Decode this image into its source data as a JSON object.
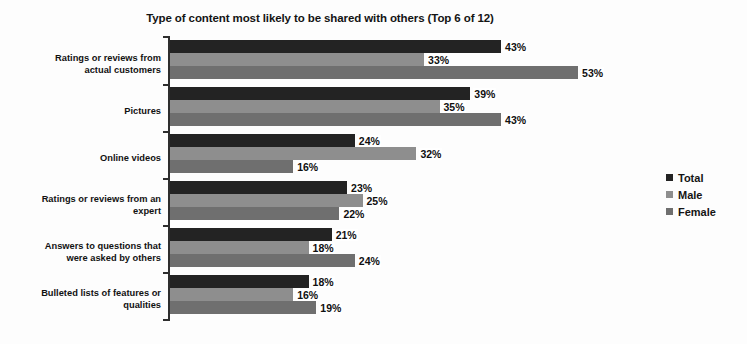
{
  "chart_data": {
    "type": "bar",
    "orientation": "horizontal",
    "title": "Type of content most likely to be shared with others (Top 6 of 12)",
    "xlabel": "",
    "ylabel": "",
    "xlim": [
      0,
      60
    ],
    "grid": false,
    "legend_position": "right",
    "value_suffix": "%",
    "categories": [
      "Ratings or reviews from actual customers",
      "Pictures",
      "Online videos",
      "Ratings or reviews from an expert",
      "Answers to questions that were asked by others",
      "Bulleted lists of features or qualities"
    ],
    "category_lines": [
      [
        "Ratings or reviews from",
        "actual customers"
      ],
      [
        "Pictures"
      ],
      [
        "Online videos"
      ],
      [
        "Ratings or reviews from an",
        "expert"
      ],
      [
        "Answers to questions that",
        "were asked by others"
      ],
      [
        "Bulleted lists of features or",
        "qualities"
      ]
    ],
    "series": [
      {
        "name": "Total",
        "color": "#232323",
        "values": [
          43,
          39,
          24,
          23,
          21,
          18
        ],
        "labels": [
          "43%",
          "39%",
          "24%",
          "23%",
          "21%",
          "18%"
        ]
      },
      {
        "name": "Male",
        "color": "#8e8e8e",
        "values": [
          33,
          35,
          32,
          25,
          18,
          16
        ],
        "labels": [
          "33%",
          "35%",
          "32%",
          "25%",
          "18%",
          "16%"
        ]
      },
      {
        "name": "Female",
        "color": "#6f6f6f",
        "values": [
          53,
          43,
          16,
          22,
          24,
          19
        ],
        "labels": [
          "53%",
          "43%",
          "16%",
          "22%",
          "24%",
          "19%"
        ]
      }
    ]
  }
}
